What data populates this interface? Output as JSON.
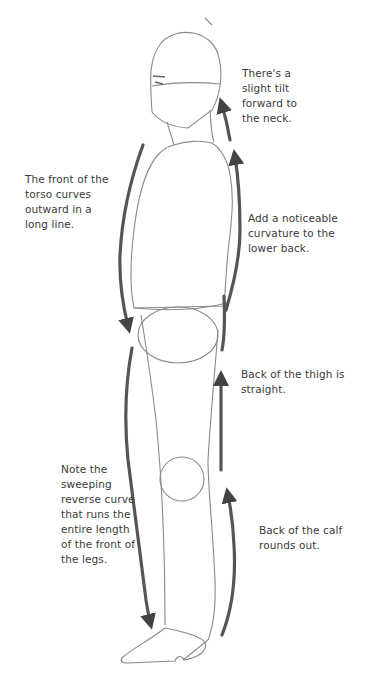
{
  "diagram": {
    "colors": {
      "background": "#ffffff",
      "outline": "#8a8a8a",
      "arrow": "#555555",
      "text": "#3a3a3a"
    },
    "annotations": [
      {
        "id": "neck",
        "text": "There's a\nslight tilt\nforward to\nthe neck.",
        "arrow_direction": "up"
      },
      {
        "id": "torso",
        "text": "The front of the\ntorso curves\noutward in a\nlong line.",
        "arrow_direction": "down"
      },
      {
        "id": "lower_back",
        "text": "Add a noticeable\ncurvature to the\nlower back.",
        "arrow_direction": "up"
      },
      {
        "id": "thigh",
        "text": "Back of the thigh is\nstraight.",
        "arrow_direction": "up"
      },
      {
        "id": "legs",
        "text": "Note the\nsweeping\nreverse curve\nthat runs the\nentire length\nof the front of\nthe legs.",
        "arrow_direction": "down"
      },
      {
        "id": "calf",
        "text": "Back of the calf\nrounds out.",
        "arrow_direction": "up"
      }
    ]
  }
}
